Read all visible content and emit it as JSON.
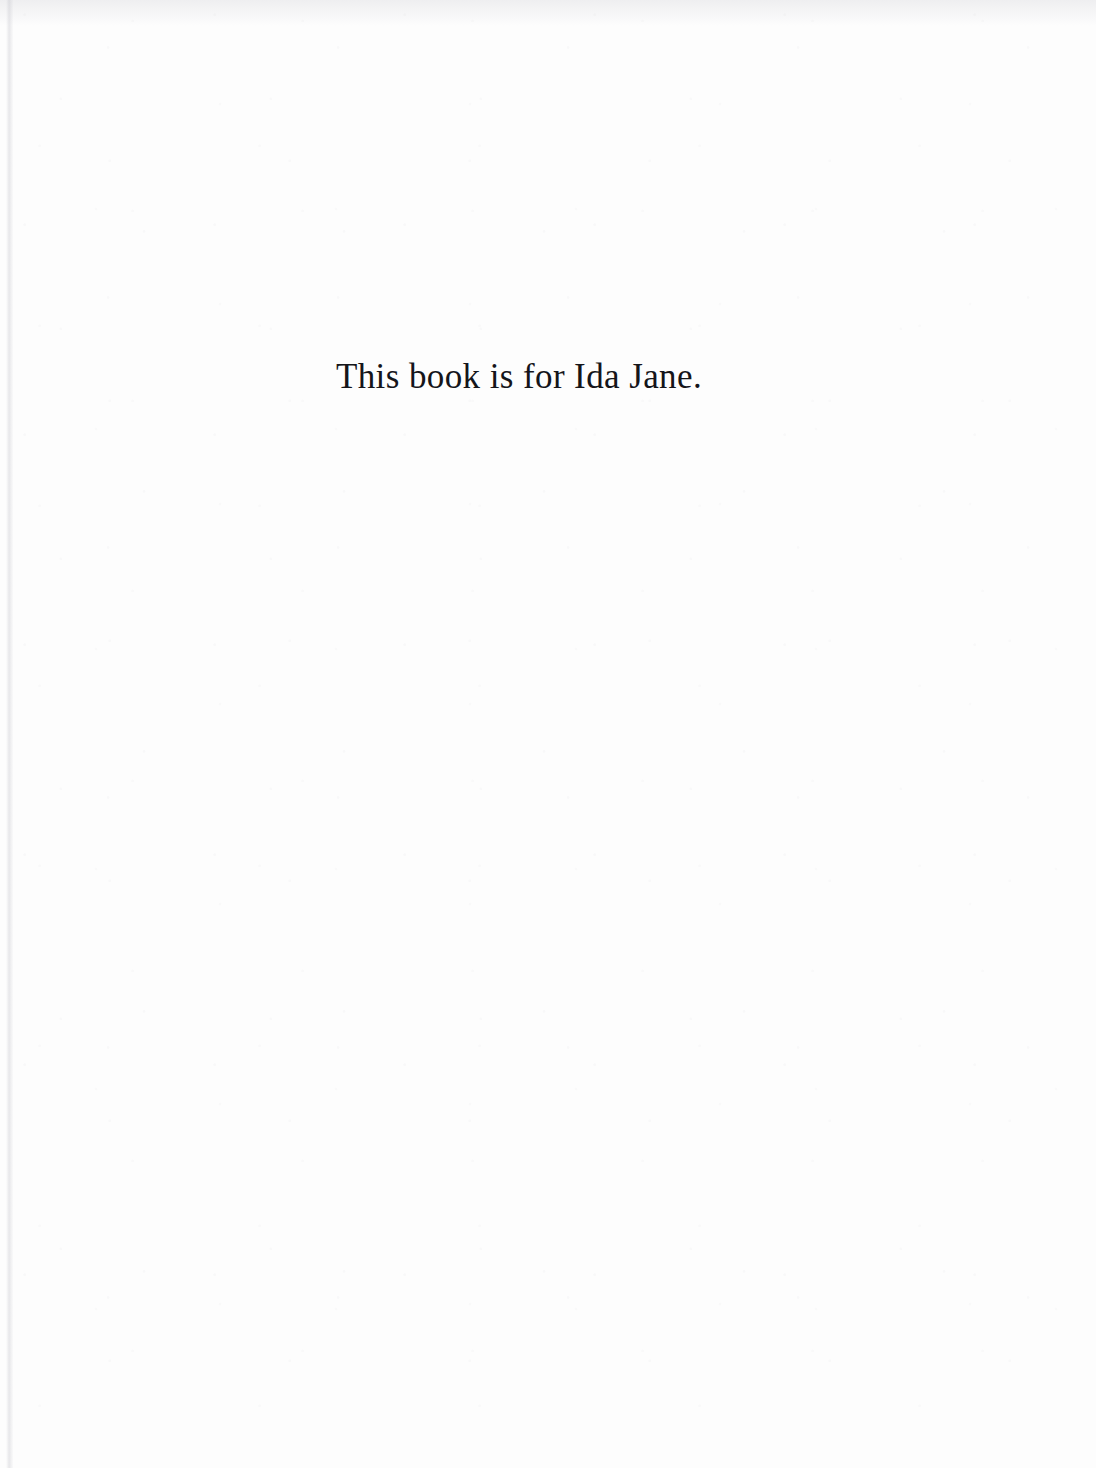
{
  "page": {
    "kind": "book-dedication-page",
    "width": 1096,
    "height": 1468,
    "background_color": "#fdfdfd",
    "ink_color": "#15151a"
  },
  "dedication": {
    "text": "This book is for Ida Jane."
  }
}
